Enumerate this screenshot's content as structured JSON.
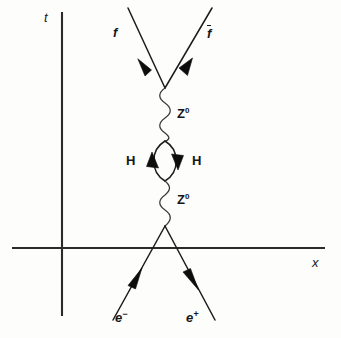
{
  "diagram": {
    "background_color": "#fdfdfc",
    "line_color": "#1c1c1c",
    "axes": {
      "time_axis_label": "t",
      "space_axis_label": "x",
      "origin": {
        "x": 62,
        "y": 248
      },
      "vertical_top": 12,
      "vertical_bottom": 316,
      "horizontal_left": 12,
      "horizontal_right": 325
    },
    "vertices": {
      "top_vertex": {
        "x": 165,
        "y": 88
      },
      "bottom_vertex": {
        "x": 165,
        "y": 226
      },
      "loop_top": {
        "x": 165,
        "y": 141
      },
      "loop_bottom": {
        "x": 165,
        "y": 181
      }
    },
    "labels": {
      "fermion_out_left": "f",
      "fermion_out_right": "f",
      "fermion_out_right_bar": true,
      "boson_upper": "Z",
      "boson_upper_charge": "0",
      "boson_lower": "Z",
      "boson_lower_charge": "0",
      "higgs_left": "H",
      "higgs_right": "H",
      "electron": "e",
      "electron_charge": "−",
      "positron": "e",
      "positron_charge": "+"
    },
    "propagators": [
      {
        "name": "upper-z-boson",
        "type": "wavy",
        "from_y": 88,
        "to_y": 141,
        "x": 165
      },
      {
        "name": "lower-z-boson",
        "type": "wavy",
        "from_y": 181,
        "to_y": 226,
        "x": 165
      }
    ],
    "loop": {
      "name": "higgs-loop",
      "type": "lens",
      "center_x": 165,
      "top_y": 141,
      "bottom_y": 181,
      "half_width": 14,
      "left_arrow_direction": "up",
      "right_arrow_direction": "down"
    },
    "external_lines": [
      {
        "name": "fermion-out-left",
        "from": [
          128,
          8
        ],
        "to": [
          165,
          88
        ],
        "arrow_direction": "down-right",
        "arrow_at": 0.62
      },
      {
        "name": "fermion-out-right",
        "from": [
          212,
          8
        ],
        "to": [
          165,
          88
        ],
        "arrow_direction": "down-left",
        "arrow_at": 0.62
      },
      {
        "name": "electron-in",
        "from": [
          113,
          320
        ],
        "to": [
          165,
          226
        ],
        "arrow_direction": "up-right",
        "arrow_at": 0.62
      },
      {
        "name": "positron-out",
        "from": [
          165,
          226
        ],
        "to": [
          215,
          320
        ],
        "arrow_direction": "down-right",
        "arrow_at": 0.38
      }
    ]
  }
}
